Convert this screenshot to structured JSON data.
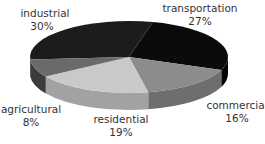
{
  "chart_data": {
    "type": "pie",
    "style": "3d",
    "title": "",
    "slices": [
      {
        "label": "industrial",
        "value": 30,
        "value_label": "30%",
        "top_color": "#1c1c1c",
        "side_color": "#111111"
      },
      {
        "label": "transportation",
        "value": 27,
        "value_label": "27%",
        "top_color": "#0b0b0b",
        "side_color": "#050505"
      },
      {
        "label": "commercial",
        "value": 16,
        "value_label": "16%",
        "top_color": "#8c8c8c",
        "side_color": "#6e6e6e"
      },
      {
        "label": "residential",
        "value": 19,
        "value_label": "19%",
        "top_color": "#c9c9c9",
        "side_color": "#a2a2a2"
      },
      {
        "label": "agricultural",
        "value": 8,
        "value_label": "8%",
        "top_color": "#6a6a6a",
        "side_color": "#3c3c3c"
      }
    ],
    "units": "percent",
    "legend": "none"
  }
}
